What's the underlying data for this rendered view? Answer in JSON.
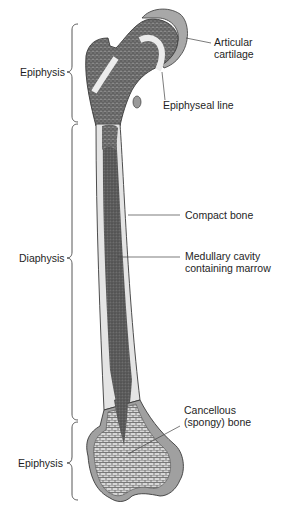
{
  "diagram": {
    "type": "anatomy",
    "colors": {
      "background": "#ffffff",
      "compact_bone": "#e4e4e4",
      "cancellous_bone": "#8c8c8c",
      "marrow": "#5a5a5a",
      "cartilage": "#a8a8a8",
      "epiphyseal_line": "#ececec",
      "outline": "#3a3a3a",
      "leader_line": "#444444"
    },
    "regions": [
      {
        "label": "Epiphysis",
        "position": "proximal"
      },
      {
        "label": "Diaphysis",
        "position": "shaft"
      },
      {
        "label": "Epiphysis",
        "position": "distal"
      }
    ],
    "callouts": {
      "articular": [
        "Articular",
        "cartilage"
      ],
      "epiphyseal": "Epiphyseal line",
      "compact": "Compact bone",
      "medullary": [
        "Medullary cavity",
        "containing marrow"
      ],
      "cancellous": [
        "Cancellous",
        "(spongy) bone"
      ]
    }
  }
}
